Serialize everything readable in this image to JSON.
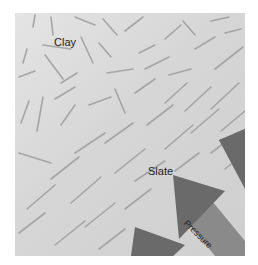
{
  "diagram": {
    "labels": {
      "clay": "Clay",
      "slate": "Slate",
      "pressure": "Pressure"
    },
    "colors": {
      "background": "#d8d8d8",
      "mineral_grains": "#9a9a9a",
      "arrows": "#6a6a6a",
      "arrow_shaft": "#8a8a8a",
      "text": "#222222"
    },
    "arrows": [
      {
        "name": "pressure-arrow-top-right",
        "direction": "up-left"
      },
      {
        "name": "pressure-arrow-middle",
        "direction": "up-left"
      },
      {
        "name": "pressure-arrow-bottom-left",
        "direction": "up-left"
      }
    ]
  }
}
